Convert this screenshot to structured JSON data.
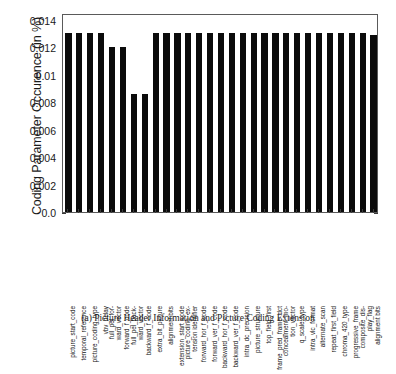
{
  "caption": "(a) Picture Header Information and Picture Coding Extension",
  "chart_data": {
    "type": "bar",
    "title": "",
    "xlabel": "",
    "ylabel": "Coding Parameter Occurence (in %)",
    "ylim": [
      0.0,
      0.0145
    ],
    "ytick_labels": [
      "0.0",
      "0.002",
      "0.004",
      "0.006",
      "0.008",
      "0.01",
      "0.012",
      "0.014"
    ],
    "ytick_values": [
      0.0,
      0.002,
      0.004,
      0.006,
      0.008,
      0.01,
      0.012,
      0.014
    ],
    "grid": false,
    "legend": null,
    "bar_color": "#0b0b0b",
    "categories": [
      "picture_start_code",
      "temporal_reference",
      "picture_coding_type",
      "vbv_delay",
      "full_pel_forward_vector",
      "forward_f_code",
      "full_pel_backward_vector",
      "backward_f_code",
      "extra_bit_picture",
      "alignment bits",
      "extension_start_code",
      "picture_coding_extension identifier",
      "forward_hor_f_code",
      "forward_ver_f_code",
      "backward_hor_f_code",
      "backward_ver_f_code",
      "intra_dc_precision",
      "picture_structure",
      "top_field_first",
      "frame_pred_frame_dct",
      "concealment_motion_vectors",
      "q_scale_type",
      "intra_vlc_format",
      "alternate_scan",
      "repeat_first_field",
      "chroma_420_type",
      "progressive_frame",
      "composite_display_flag",
      "alignment bits"
    ],
    "categories_wrapped": [
      [
        "picture_start_code",
        ""
      ],
      [
        "temporal_reference",
        ""
      ],
      [
        "picture_coding_type",
        ""
      ],
      [
        "vbv_delay",
        ""
      ],
      [
        "full_pel_for-",
        "ward_vector"
      ],
      [
        "forward_f_code",
        ""
      ],
      [
        "full_pel_back-",
        "ward_vector"
      ],
      [
        "backward_f_code",
        ""
      ],
      [
        "extra_bit_picture",
        ""
      ],
      [
        "alignment bits",
        ""
      ],
      [
        "extension_start_code",
        ""
      ],
      [
        "picture_coding_ex-",
        "tension identifier"
      ],
      [
        "forward_hor_f_code",
        ""
      ],
      [
        "forward_ver_f_code",
        ""
      ],
      [
        "backward_hor_f_code",
        ""
      ],
      [
        "backward_ver_f_code",
        ""
      ],
      [
        "intra_dc_precision",
        ""
      ],
      [
        "picture_structure",
        ""
      ],
      [
        "top_field_first",
        ""
      ],
      [
        "frame_pred_frame_dct",
        ""
      ],
      [
        "concealment_mo-",
        "tion_vector"
      ],
      [
        "q_scale_type",
        ""
      ],
      [
        "intra_vlc_format",
        ""
      ],
      [
        "alternate_scan",
        ""
      ],
      [
        "repeat_first_field",
        ""
      ],
      [
        "chroma_420_type",
        ""
      ],
      [
        "progressive_frame",
        ""
      ],
      [
        "composite_dis-",
        "play_flag"
      ],
      [
        "alignment bits",
        ""
      ]
    ],
    "values": [
      0.01303,
      0.01303,
      0.01303,
      0.01303,
      0.01206,
      0.01206,
      0.0086,
      0.0086,
      0.01303,
      0.01303,
      0.01303,
      0.01303,
      0.01303,
      0.01303,
      0.01303,
      0.01303,
      0.01303,
      0.01303,
      0.01303,
      0.01303,
      0.01303,
      0.01303,
      0.01303,
      0.01303,
      0.01303,
      0.01303,
      0.01303,
      0.01303,
      0.01288
    ]
  }
}
